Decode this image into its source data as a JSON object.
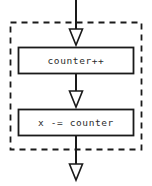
{
  "diagram": {
    "type": "flowchart",
    "title": "",
    "canvas": {
      "width": 152,
      "height": 186,
      "background": "#ffffff"
    },
    "colors": {
      "stroke": "#1a1a1a",
      "node_fill": "#ffffff",
      "text": "#2b2b2b",
      "group_border": "#1a1a1a"
    },
    "group": {
      "label": "",
      "border_style": "dashed",
      "x": 10,
      "y": 22,
      "width": 132,
      "height": 128
    },
    "nodes": [
      {
        "id": "node-increment",
        "label": "counter++",
        "shape": "rectangle",
        "x": 18,
        "y": 47,
        "width": 116,
        "height": 27
      },
      {
        "id": "node-subtract",
        "label": "x -= counter",
        "shape": "rectangle",
        "x": 18,
        "y": 109,
        "width": 116,
        "height": 27
      }
    ],
    "edges": [
      {
        "id": "edge-entry",
        "from": "",
        "to": "node-increment",
        "arrow": "open-triangle-down"
      },
      {
        "id": "edge-middle",
        "from": "node-increment",
        "to": "node-subtract",
        "arrow": "open-triangle-down"
      },
      {
        "id": "edge-exit",
        "from": "node-subtract",
        "to": "",
        "arrow": "open-triangle-down"
      }
    ]
  }
}
